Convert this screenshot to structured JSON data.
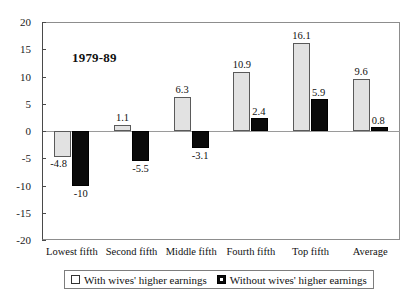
{
  "chart_data": {
    "type": "bar",
    "title": "",
    "annotation": "1979-89",
    "xlabel": "",
    "ylabel": "",
    "ylim": [
      -20,
      20
    ],
    "ytick_step": 5,
    "yticks": [
      20,
      15,
      10,
      5,
      0,
      -5,
      -10,
      -15,
      -20
    ],
    "ytick_labels": [
      "20",
      "15",
      "10",
      "5",
      "0",
      "-5",
      "-10",
      "-15",
      "-20"
    ],
    "grid": false,
    "legend_position": "bottom",
    "categories": [
      "Lowest fifth",
      "Second fifth",
      "Middle fifth",
      "Fourth fifth",
      "Top fifth",
      "Average"
    ],
    "series": [
      {
        "name": "With wives' higher earnings",
        "color": "#e2e2e2",
        "values": [
          -4.8,
          1.1,
          6.3,
          10.9,
          16.1,
          9.6
        ],
        "labels": [
          "-4.8",
          "1.1",
          "6.3",
          "10.9",
          "16.1",
          "9.6"
        ]
      },
      {
        "name": "Without wives' higher earnings",
        "color": "#0a0a0a",
        "values": [
          -10,
          -5.5,
          -3.1,
          2.4,
          5.9,
          0.8
        ],
        "labels": [
          "-10",
          "-5.5",
          "-3.1",
          "2.4",
          "5.9",
          "0.8"
        ]
      }
    ]
  },
  "legend": {
    "entries": [
      {
        "label": "With wives' higher earnings",
        "swatch": "light"
      },
      {
        "label": "Without wives' higher earnings",
        "swatch": "dark"
      }
    ]
  }
}
